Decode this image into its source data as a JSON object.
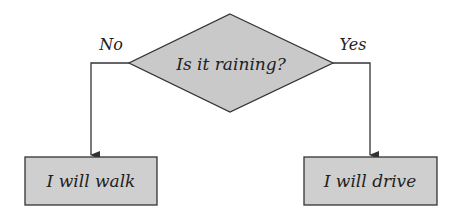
{
  "diagram": {
    "type": "flowchart",
    "decision": {
      "text": "Is it raining?",
      "fill": "#c9c9c9"
    },
    "branches": {
      "left": {
        "label": "No",
        "outcome": "I will walk"
      },
      "right": {
        "label": "Yes",
        "outcome": "I will drive"
      }
    },
    "colors": {
      "stroke": "#333333",
      "box_fill": "#cfcfcf",
      "text": "#222222"
    }
  }
}
